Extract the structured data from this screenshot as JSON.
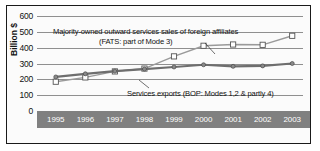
{
  "figure": {
    "background": "#fbfbfb",
    "border_color": "#1a1a1a",
    "axis_band_color": "#808080"
  },
  "axes": {
    "ylabel": "Billion $",
    "yticks": [
      "600",
      "500",
      "400",
      "300",
      "200",
      "100",
      "0"
    ],
    "xticks": [
      "1995",
      "1996",
      "1997",
      "1998",
      "1999",
      "2000",
      "2001",
      "2002",
      "2003"
    ]
  },
  "annotations": {
    "fats_line1": "Majority-owned outward services sales of foreign affiliates",
    "fats_line2": "(FATS: part of Mode 3)",
    "bop_label": "Services exports (BOP: Modes 1,2 & partly 4)"
  },
  "chart_data": {
    "type": "line",
    "title": "",
    "xlabel": "",
    "ylabel": "Billion $",
    "ylim": [
      0,
      600
    ],
    "grid": true,
    "legend_position": "inline-annotations",
    "categories": [
      "1995",
      "1996",
      "1997",
      "1998",
      "1999",
      "2000",
      "2001",
      "2002",
      "2003"
    ],
    "series": [
      {
        "name": "Majority-owned outward services sales of foreign affiliates (FATS: part of Mode 3)",
        "marker": "open-square",
        "color": "#9a9a9a",
        "values": [
          185,
          212,
          250,
          268,
          345,
          412,
          420,
          418,
          475
        ]
      },
      {
        "name": "Services exports (BOP: Modes 1,2 & partly 4)",
        "marker": "filled-circle",
        "color": "#6e6e6e",
        "values": [
          215,
          235,
          252,
          265,
          278,
          292,
          282,
          285,
          300
        ]
      }
    ]
  }
}
